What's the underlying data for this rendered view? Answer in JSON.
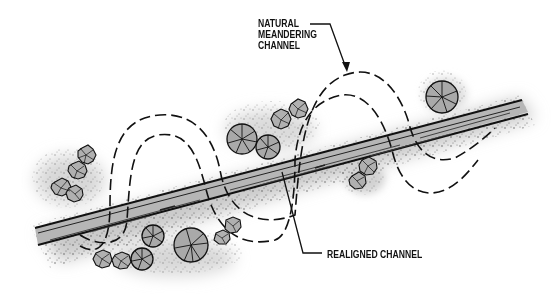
{
  "diagram": {
    "labels": {
      "natural": {
        "lines": [
          "NATURAL",
          "MEANDERING",
          "CHANNEL"
        ]
      },
      "realigned": {
        "text": "REALIGNED CHANNEL"
      }
    },
    "elements": {
      "natural_channel": {
        "style": "dashed-outline",
        "color": "#111111"
      },
      "realigned_channel": {
        "style": "solid-straight",
        "fill": "#b4b4b4",
        "color": "#222222"
      },
      "riparian_buffer": {
        "style": "soft-gray-shadow",
        "color": "#c8c8c8"
      },
      "trees": {
        "style": "wheel-canopy",
        "fill": "#a8a8a8",
        "count": 7
      },
      "shrubs": {
        "style": "star-canopy",
        "fill": "#b0b0b0",
        "clusters": 4
      }
    },
    "colors": {
      "ink": "#111111",
      "channel_fill": "#b4b4b4",
      "buffer": "#cfcfcf",
      "background": "#ffffff"
    }
  }
}
